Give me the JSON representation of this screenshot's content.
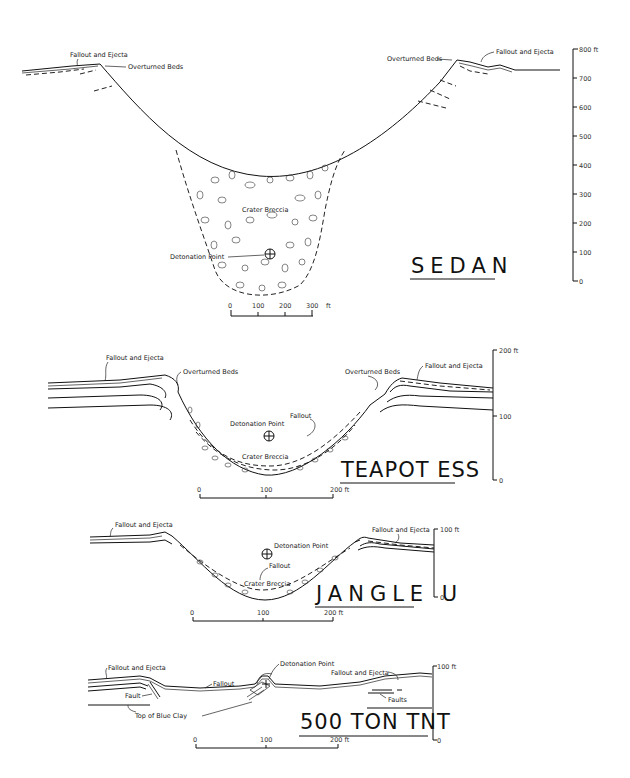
{
  "figure": {
    "panels": [
      {
        "id": "sedan",
        "title": "SEDAN",
        "labels": {
          "fallout_left": "Fallout and Ejecta",
          "overturned_left": "Overturned Beds",
          "overturned_right": "Overturned Beds",
          "fallout_right": "Fallout and Ejecta",
          "breccia": "Crater Breccia",
          "detonation": "Detonation Point"
        },
        "scale_bar": {
          "ticks": [
            "0",
            "100",
            "200",
            "300"
          ],
          "unit": "ft"
        },
        "vertical_axis": {
          "ticks": [
            "800 ft",
            "700",
            "600",
            "500",
            "400",
            "300",
            "200",
            "100",
            "0"
          ]
        }
      },
      {
        "id": "teapot-ess",
        "title": "TEAPOT ESS",
        "labels": {
          "fallout_left": "Fallout and Ejecta",
          "overturned_left": "Overturned Beds",
          "overturned_right": "Overturned Beds",
          "fallout_right": "Fallout and Ejecta",
          "fallout": "Fallout",
          "detonation": "Detonation Point",
          "breccia": "Crater Breccia"
        },
        "scale_bar": {
          "ticks": [
            "0",
            "100",
            "200 ft"
          ]
        },
        "vertical_axis": {
          "ticks": [
            "200 ft",
            "100",
            "0"
          ]
        }
      },
      {
        "id": "jangle-u",
        "title": "JANGLE U",
        "labels": {
          "fallout_left": "Fallout and Ejecta",
          "fallout_right": "Fallout and Ejecta",
          "detonation": "Detonation Point",
          "fallout": "Fallout",
          "breccia": "Crater Breccia"
        },
        "scale_bar": {
          "ticks": [
            "0",
            "100",
            "200 ft"
          ]
        },
        "vertical_axis": {
          "ticks": [
            "100 ft",
            "0"
          ]
        }
      },
      {
        "id": "500-ton-tnt",
        "title": "500 TON TNT",
        "labels": {
          "fallout_left": "Fallout and Ejecta",
          "fault": "Fault",
          "blue_clay": "Top of Blue Clay",
          "fallout": "Fallout",
          "detonation": "Detonation Point",
          "fallout_right": "Fallout and Ejecta",
          "faults": "Faults"
        },
        "scale_bar": {
          "ticks": [
            "0",
            "100",
            "200 ft"
          ]
        },
        "vertical_axis": {
          "ticks": [
            "100 ft",
            "0"
          ]
        }
      }
    ]
  }
}
